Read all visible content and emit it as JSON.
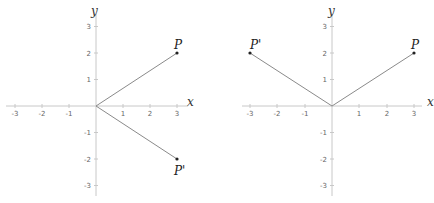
{
  "diagrams": [
    {
      "name": "reflection-across-x-axis",
      "axes": {
        "x_label": "x",
        "y_label": "y",
        "x_range": [
          -3,
          3
        ],
        "y_range": [
          -3,
          3
        ]
      },
      "x_ticks": [
        "-3",
        "-2",
        "-1",
        "1",
        "2",
        "3"
      ],
      "y_ticks": [
        "3",
        "2",
        "1",
        "-1",
        "-2",
        "-3"
      ],
      "points": [
        {
          "label": "P",
          "x": 3,
          "y": 2
        },
        {
          "label": "P'",
          "x": 3,
          "y": -2
        }
      ],
      "segments": [
        {
          "from": [
            0,
            0
          ],
          "to": [
            3,
            2
          ]
        },
        {
          "from": [
            0,
            0
          ],
          "to": [
            3,
            -2
          ]
        }
      ]
    },
    {
      "name": "reflection-across-y-axis",
      "axes": {
        "x_label": "x",
        "y_label": "y",
        "x_range": [
          -3,
          3
        ],
        "y_range": [
          -3,
          3
        ]
      },
      "x_ticks": [
        "-3",
        "-2",
        "-1",
        "1",
        "2",
        "3"
      ],
      "y_ticks": [
        "3",
        "2",
        "1",
        "-1",
        "-2",
        "-3"
      ],
      "points": [
        {
          "label": "P'",
          "x": -3,
          "y": 2
        },
        {
          "label": "P",
          "x": 3,
          "y": 2
        }
      ],
      "segments": [
        {
          "from": [
            0,
            0
          ],
          "to": [
            -3,
            2
          ]
        },
        {
          "from": [
            0,
            0
          ],
          "to": [
            3,
            2
          ]
        }
      ]
    }
  ]
}
